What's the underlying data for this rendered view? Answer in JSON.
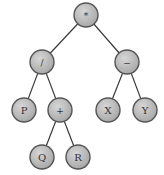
{
  "diagram": {
    "type": "expression-tree",
    "colors": {
      "node_fill": "#b8b8b8",
      "node_highlight": "#d6d6d6",
      "node_stroke": "#555555",
      "edge": "#3a3a3a",
      "text": "#333333",
      "background": "#ffffff"
    },
    "nodes": [
      {
        "id": "n0",
        "label": "*",
        "x": 86,
        "y": 15,
        "kind": "operator"
      },
      {
        "id": "n1",
        "label": "/",
        "x": 42,
        "y": 62,
        "kind": "operator"
      },
      {
        "id": "n2",
        "label": "−",
        "x": 127,
        "y": 62,
        "kind": "operator"
      },
      {
        "id": "n3",
        "label": "P",
        "x": 24,
        "y": 110,
        "kind": "operand"
      },
      {
        "id": "n4",
        "label": "+",
        "x": 60,
        "y": 110,
        "kind": "operator"
      },
      {
        "id": "n5",
        "label": "X",
        "x": 108,
        "y": 110,
        "kind": "operand"
      },
      {
        "id": "n6",
        "label": "Y",
        "x": 145,
        "y": 110,
        "kind": "operand"
      },
      {
        "id": "n7",
        "label": "Q",
        "x": 42,
        "y": 157,
        "kind": "operand"
      },
      {
        "id": "n8",
        "label": "R",
        "x": 78,
        "y": 157,
        "kind": "operand"
      }
    ],
    "edges": [
      {
        "from": "n0",
        "to": "n1"
      },
      {
        "from": "n0",
        "to": "n2"
      },
      {
        "from": "n1",
        "to": "n3"
      },
      {
        "from": "n1",
        "to": "n4"
      },
      {
        "from": "n2",
        "to": "n5"
      },
      {
        "from": "n2",
        "to": "n6"
      },
      {
        "from": "n4",
        "to": "n7"
      },
      {
        "from": "n4",
        "to": "n8"
      }
    ],
    "node_radius": 12
  }
}
